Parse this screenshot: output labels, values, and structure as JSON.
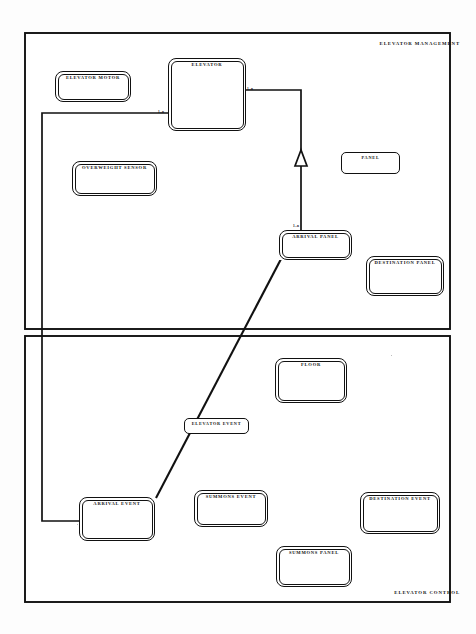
{
  "document": {
    "title": "Elevator Domain Model",
    "background_color": "#fdfdfd",
    "line_color": "#111111"
  },
  "frames": [
    {
      "id": "elevator-management",
      "title": "ELEVATOR MANAGEMENT",
      "x": 25,
      "y": 33,
      "w": 425,
      "h": 296
    },
    {
      "id": "elevator-control",
      "title": "ELEVATOR CONTROL",
      "x": 25,
      "y": 336,
      "w": 425,
      "h": 266
    }
  ],
  "nodes": [
    {
      "id": "elevator-motor",
      "label": "ELEVATOR MOTOR",
      "x": 55,
      "y": 71,
      "w": 76,
      "h": 31,
      "style": "double"
    },
    {
      "id": "elevator",
      "label": "ELEVATOR",
      "x": 168,
      "y": 58,
      "w": 78,
      "h": 73,
      "style": "double"
    },
    {
      "id": "overweight-sensor",
      "label": "OVERWEIGHT SENSOR",
      "x": 72,
      "y": 161,
      "w": 85,
      "h": 35,
      "style": "double"
    },
    {
      "id": "panel",
      "label": "PANEL",
      "x": 341,
      "y": 152,
      "w": 59,
      "h": 22,
      "style": "single"
    },
    {
      "id": "arrival-panel",
      "label": "ARRIVAL PANEL",
      "x": 279,
      "y": 230,
      "w": 73,
      "h": 30,
      "style": "double"
    },
    {
      "id": "destination-panel",
      "label": "DESTINATION PANEL",
      "x": 366,
      "y": 256,
      "w": 78,
      "h": 40,
      "style": "double"
    },
    {
      "id": "floor",
      "label": "FLOOR",
      "x": 275,
      "y": 358,
      "w": 72,
      "h": 45,
      "style": "double"
    },
    {
      "id": "elevator-event",
      "label": "ELEVATOR EVENT",
      "x": 184,
      "y": 418,
      "w": 65,
      "h": 16,
      "style": "single"
    },
    {
      "id": "arrival-event",
      "label": "ARRIVAL EVENT",
      "x": 79,
      "y": 497,
      "w": 76,
      "h": 44,
      "style": "double"
    },
    {
      "id": "summons-event",
      "label": "SUMMONS EVENT",
      "x": 194,
      "y": 490,
      "w": 74,
      "h": 37,
      "style": "double"
    },
    {
      "id": "destination-event",
      "label": "DESTINATION EVENT",
      "x": 360,
      "y": 492,
      "w": 80,
      "h": 42,
      "style": "double"
    },
    {
      "id": "summons-panel",
      "label": "SUMMONS PANEL",
      "x": 276,
      "y": 546,
      "w": 76,
      "h": 41,
      "style": "double"
    }
  ],
  "associations": [
    {
      "id": "elevator-to-arrival-event",
      "from": "arrival-event",
      "to": "elevator",
      "multiplicity": "1..n",
      "multiplicity_x": 158,
      "multiplicity_y": 112
    },
    {
      "id": "elevator-to-arrival-panel",
      "from": "elevator",
      "to": "arrival-panel",
      "arrow": "generalization-triangle",
      "multiplicity": "1..n",
      "multiplicity_x": 243,
      "multiplicity_y": 89
    },
    {
      "id": "arrival-panel-multiplicity",
      "from": "arrival-panel",
      "to": "elevator",
      "multiplicity": "1..n",
      "multiplicity_x": 293,
      "multiplicity_y": 227
    },
    {
      "id": "arrival-panel-to-arrival-event",
      "from": "arrival-panel",
      "to": "arrival-event",
      "kind": "diagonal"
    }
  ]
}
